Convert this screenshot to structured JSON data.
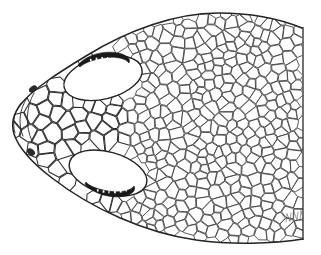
{
  "figure": {
    "title": "Dorsal view of reptile head scalation",
    "view": "dorsal",
    "technique": "ink line drawing",
    "background_color": "#ffffff",
    "line_color": "#3a3a3a",
    "outline_color": "#232323",
    "dark_marking_color": "#1a1a1a",
    "canvas": {
      "width": 321,
      "height": 255
    }
  },
  "anatomy": {
    "head_outline": {
      "name": "head-outline",
      "description": "Tapering ovoid head, snout at left, truncated at right margin",
      "path": "M 302 28 C 280 19 252 13 218 13 C 176 13 128 30 86 56 C 58 73 33 89 21 104 C 13 114 11 124 14 134 C 18 146 31 162 52 178 C 92 209 146 233 196 240 C 232 245 272 244 303 239"
    },
    "truncation_edge": {
      "name": "right-truncation-edge",
      "description": "Straight vertical cut where the drawing is cropped",
      "x": 303,
      "y1": 27,
      "y2": 240
    },
    "snout_rim": {
      "name": "snout-rim-line",
      "paths": [
        "M 21 103 C 14 112 12 123 15 133",
        "M 27 98 C 19 110 18 124 23 136",
        "M 34 93 C 26 107 25 126 32 141"
      ]
    },
    "eyes": [
      {
        "name": "eye-upper",
        "label": "left eye (upper in dorsal view)",
        "center": {
          "x": 103,
          "y": 78
        },
        "rx": 40,
        "ry": 21,
        "rotation": -14,
        "dark_marking": {
          "name": "eye-upper-dark-lid",
          "description": "dark crescent supraocular marking above the eye",
          "path": "M 78 65 C 86 55 104 50 118 53 C 127 55 131 59 129 63 C 126 58 114 56 103 58 C 92 60 84 63 80 67 Z"
        }
      },
      {
        "name": "eye-lower",
        "label": "right eye (lower in dorsal view)",
        "center": {
          "x": 108,
          "y": 173
        },
        "rx": 40,
        "ry": 21,
        "rotation": 16,
        "dark_marking": {
          "name": "eye-lower-dark-lid",
          "description": "dark crescent marking below the eye",
          "path": "M 85 184 C 93 194 112 199 125 196 C 133 194 136 190 134 186 C 131 191 119 193 108 191 C 97 189 89 186 86 182 Z"
        }
      }
    ],
    "nostrils": [
      {
        "name": "nostril-upper",
        "center": {
          "x": 33,
          "y": 89
        },
        "rx": 4.2,
        "ry": 2.6,
        "rotation": -35
      },
      {
        "name": "nostril-lower",
        "center": {
          "x": 31,
          "y": 152
        },
        "rx": 4.2,
        "ry": 2.8,
        "rotation": 38
      }
    ],
    "signature": {
      "name": "artist-signature-mark",
      "description": "faint illegible pencil signature at lower right",
      "position": {
        "x": 286,
        "y": 214
      },
      "strokes": [
        "M 286 222 L 287 214 M 287 214 L 290 221 M 290 221 L 291 213",
        "M 293 221 L 294 212 M 294 212 L 297 220 M 297 220 L 298 212",
        "M 300 220 L 301 211 M 301 211 L 303 218"
      ]
    }
  },
  "scale_regions": [
    {
      "name": "frontal-plates",
      "label": "enlarged frontal / prefrontal head plates",
      "cell_style": "plate-cell",
      "seed": 17,
      "cell_count": 34,
      "mean_cell_size": 15
    },
    {
      "name": "rostral-plates",
      "label": "rostral and internasal plates at snout tip",
      "cell_style": "plate-cell",
      "seed": 23,
      "cell_count": 18,
      "mean_cell_size": 13
    },
    {
      "name": "parietal-field",
      "label": "irregular polygonal parietal scales behind the eyes",
      "cell_style": "scale-cell",
      "seed": 41,
      "cell_count": 120,
      "mean_cell_size": 11
    },
    {
      "name": "nuchal-field",
      "label": "regular diagonal rows of rounded dorsal body scales",
      "cell_style": "scale-cell",
      "seed": 7,
      "cell_count": 430,
      "mean_cell_size": 9
    }
  ],
  "scale_mesh": {
    "description": "Procedural Voronoi-like mosaic clipped to the head outline",
    "jitter": 0.42,
    "rows_direction_degrees": -28,
    "body_row_spacing": 9.2,
    "head_cell_spacing": 12.5,
    "stroke_width": 0.85
  }
}
